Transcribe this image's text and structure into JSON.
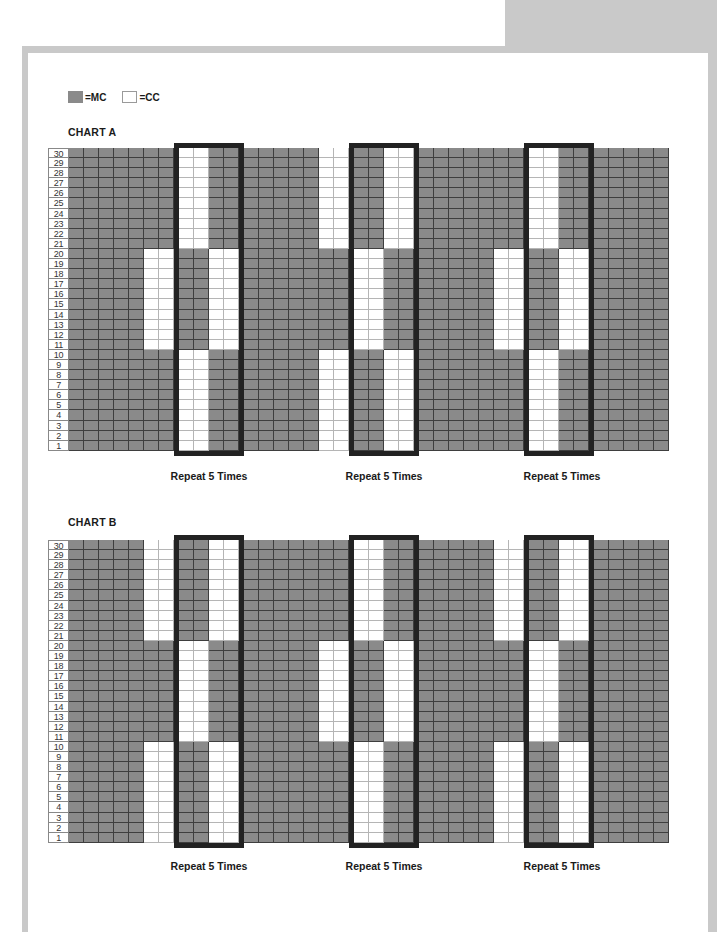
{
  "legend": {
    "items": [
      {
        "swatch": "mc",
        "label": "=MC"
      },
      {
        "swatch": "cc",
        "label": "=CC"
      }
    ]
  },
  "colors": {
    "MC": "#8a8a8a",
    "CC": "#ffffff",
    "box_border": "#222222",
    "frame": "#c9c9c9"
  },
  "chart_data": [
    {
      "type": "heatmap",
      "title": "CHART A",
      "rows": 30,
      "row_labels_top_to_bottom": [
        30,
        29,
        28,
        27,
        26,
        25,
        24,
        23,
        22,
        21,
        20,
        19,
        18,
        17,
        16,
        15,
        14,
        13,
        12,
        11,
        10,
        9,
        8,
        7,
        6,
        5,
        4,
        3,
        2,
        1
      ],
      "legend": {
        "M": "MC",
        "W": "CC"
      },
      "row_bands": {
        "top": "rows 21-30",
        "mid": "rows 11-20",
        "bot": "rows 1-10"
      },
      "columns": [
        {
          "group": "plain",
          "cols": [
            {
              "top": "M",
              "mid": "M",
              "bot": "M"
            },
            {
              "top": "M",
              "mid": "M",
              "bot": "M"
            },
            {
              "top": "M",
              "mid": "M",
              "bot": "M"
            },
            {
              "top": "M",
              "mid": "M",
              "bot": "M"
            },
            {
              "top": "M",
              "mid": "M",
              "bot": "M"
            },
            {
              "top": "M",
              "mid": "W",
              "bot": "M"
            },
            {
              "top": "M",
              "mid": "W",
              "bot": "M"
            }
          ]
        },
        {
          "group": "box",
          "label": "Repeat 5 Times",
          "cols": [
            {
              "top": "W",
              "mid": "M",
              "bot": "W"
            },
            {
              "top": "W",
              "mid": "M",
              "bot": "W"
            },
            {
              "top": "M",
              "mid": "W",
              "bot": "M"
            },
            {
              "top": "M",
              "mid": "W",
              "bot": "M"
            }
          ]
        },
        {
          "group": "plain",
          "cols": [
            {
              "top": "M",
              "mid": "M",
              "bot": "M"
            },
            {
              "top": "M",
              "mid": "M",
              "bot": "M"
            },
            {
              "top": "M",
              "mid": "M",
              "bot": "M"
            },
            {
              "top": "M",
              "mid": "M",
              "bot": "M"
            },
            {
              "top": "M",
              "mid": "M",
              "bot": "M"
            },
            {
              "top": "W",
              "mid": "M",
              "bot": "W"
            },
            {
              "top": "W",
              "mid": "M",
              "bot": "W"
            }
          ]
        },
        {
          "group": "box",
          "label": "Repeat 5 Times",
          "cols": [
            {
              "top": "M",
              "mid": "W",
              "bot": "M"
            },
            {
              "top": "M",
              "mid": "W",
              "bot": "M"
            },
            {
              "top": "W",
              "mid": "M",
              "bot": "W"
            },
            {
              "top": "W",
              "mid": "M",
              "bot": "W"
            }
          ]
        },
        {
          "group": "plain",
          "cols": [
            {
              "top": "M",
              "mid": "M",
              "bot": "M"
            },
            {
              "top": "M",
              "mid": "M",
              "bot": "M"
            },
            {
              "top": "M",
              "mid": "M",
              "bot": "M"
            },
            {
              "top": "M",
              "mid": "M",
              "bot": "M"
            },
            {
              "top": "M",
              "mid": "M",
              "bot": "M"
            },
            {
              "top": "M",
              "mid": "W",
              "bot": "M"
            },
            {
              "top": "M",
              "mid": "W",
              "bot": "M"
            }
          ]
        },
        {
          "group": "box",
          "label": "Repeat 5 Times",
          "cols": [
            {
              "top": "W",
              "mid": "M",
              "bot": "W"
            },
            {
              "top": "W",
              "mid": "M",
              "bot": "W"
            },
            {
              "top": "M",
              "mid": "W",
              "bot": "M"
            },
            {
              "top": "M",
              "mid": "W",
              "bot": "M"
            }
          ]
        },
        {
          "group": "plain",
          "cols": [
            {
              "top": "M",
              "mid": "M",
              "bot": "M"
            },
            {
              "top": "M",
              "mid": "M",
              "bot": "M"
            },
            {
              "top": "M",
              "mid": "M",
              "bot": "M"
            },
            {
              "top": "M",
              "mid": "M",
              "bot": "M"
            },
            {
              "top": "M",
              "mid": "M",
              "bot": "M"
            }
          ]
        }
      ]
    },
    {
      "type": "heatmap",
      "title": "CHART B",
      "rows": 30,
      "row_labels_top_to_bottom": [
        30,
        29,
        28,
        27,
        26,
        25,
        24,
        23,
        22,
        21,
        20,
        19,
        18,
        17,
        16,
        15,
        14,
        13,
        12,
        11,
        10,
        9,
        8,
        7,
        6,
        5,
        4,
        3,
        2,
        1
      ],
      "legend": {
        "M": "MC",
        "W": "CC"
      },
      "row_bands": {
        "top": "rows 21-30",
        "mid": "rows 11-20",
        "bot": "rows 1-10"
      },
      "columns": [
        {
          "group": "plain",
          "cols": [
            {
              "top": "M",
              "mid": "M",
              "bot": "M"
            },
            {
              "top": "M",
              "mid": "M",
              "bot": "M"
            },
            {
              "top": "M",
              "mid": "M",
              "bot": "M"
            },
            {
              "top": "M",
              "mid": "M",
              "bot": "M"
            },
            {
              "top": "M",
              "mid": "M",
              "bot": "M"
            },
            {
              "top": "W",
              "mid": "M",
              "bot": "W"
            },
            {
              "top": "W",
              "mid": "M",
              "bot": "W"
            }
          ]
        },
        {
          "group": "box",
          "label": "Repeat 5 Times",
          "cols": [
            {
              "top": "M",
              "mid": "W",
              "bot": "M"
            },
            {
              "top": "M",
              "mid": "W",
              "bot": "M"
            },
            {
              "top": "W",
              "mid": "M",
              "bot": "W"
            },
            {
              "top": "W",
              "mid": "M",
              "bot": "W"
            }
          ]
        },
        {
          "group": "plain",
          "cols": [
            {
              "top": "M",
              "mid": "M",
              "bot": "M"
            },
            {
              "top": "M",
              "mid": "M",
              "bot": "M"
            },
            {
              "top": "M",
              "mid": "M",
              "bot": "M"
            },
            {
              "top": "M",
              "mid": "M",
              "bot": "M"
            },
            {
              "top": "M",
              "mid": "M",
              "bot": "M"
            },
            {
              "top": "M",
              "mid": "W",
              "bot": "M"
            },
            {
              "top": "M",
              "mid": "W",
              "bot": "M"
            }
          ]
        },
        {
          "group": "box",
          "label": "Repeat 5 Times",
          "cols": [
            {
              "top": "W",
              "mid": "M",
              "bot": "W"
            },
            {
              "top": "W",
              "mid": "M",
              "bot": "W"
            },
            {
              "top": "M",
              "mid": "W",
              "bot": "M"
            },
            {
              "top": "M",
              "mid": "W",
              "bot": "M"
            }
          ]
        },
        {
          "group": "plain",
          "cols": [
            {
              "top": "M",
              "mid": "M",
              "bot": "M"
            },
            {
              "top": "M",
              "mid": "M",
              "bot": "M"
            },
            {
              "top": "M",
              "mid": "M",
              "bot": "M"
            },
            {
              "top": "M",
              "mid": "M",
              "bot": "M"
            },
            {
              "top": "M",
              "mid": "M",
              "bot": "M"
            },
            {
              "top": "W",
              "mid": "M",
              "bot": "W"
            },
            {
              "top": "W",
              "mid": "M",
              "bot": "W"
            }
          ]
        },
        {
          "group": "box",
          "label": "Repeat 5 Times",
          "cols": [
            {
              "top": "M",
              "mid": "W",
              "bot": "M"
            },
            {
              "top": "M",
              "mid": "W",
              "bot": "M"
            },
            {
              "top": "W",
              "mid": "M",
              "bot": "W"
            },
            {
              "top": "W",
              "mid": "M",
              "bot": "W"
            }
          ]
        },
        {
          "group": "plain",
          "cols": [
            {
              "top": "M",
              "mid": "M",
              "bot": "M"
            },
            {
              "top": "M",
              "mid": "M",
              "bot": "M"
            },
            {
              "top": "M",
              "mid": "M",
              "bot": "M"
            },
            {
              "top": "M",
              "mid": "M",
              "bot": "M"
            },
            {
              "top": "M",
              "mid": "M",
              "bot": "M"
            }
          ]
        }
      ]
    }
  ],
  "charts": {
    "a": {
      "title": "CHART A",
      "repeat_labels": [
        "Repeat 5 Times",
        "Repeat 5 Times",
        "Repeat 5 Times"
      ]
    },
    "b": {
      "title": "CHART B",
      "repeat_labels": [
        "Repeat 5 Times",
        "Repeat 5 Times",
        "Repeat 5 Times"
      ]
    }
  }
}
